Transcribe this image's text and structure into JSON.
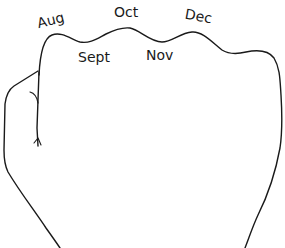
{
  "diagram": {
    "stroke_color": "#1a1a1a",
    "background": "#ffffff",
    "knuckle_labels": [
      {
        "label": "Aug",
        "position": "knuckle",
        "x": 37,
        "y": 12,
        "rotate": -14
      },
      {
        "label": "Oct",
        "position": "knuckle",
        "x": 114,
        "y": 6,
        "rotate": 0
      },
      {
        "label": "Dec",
        "position": "knuckle",
        "x": 185,
        "y": 11,
        "rotate": 10
      }
    ],
    "valley_labels": [
      {
        "label": "Sept",
        "position": "valley",
        "x": 78,
        "y": 52,
        "rotate": 0
      },
      {
        "label": "Nov",
        "position": "valley",
        "x": 146,
        "y": 49,
        "rotate": 0
      }
    ]
  }
}
